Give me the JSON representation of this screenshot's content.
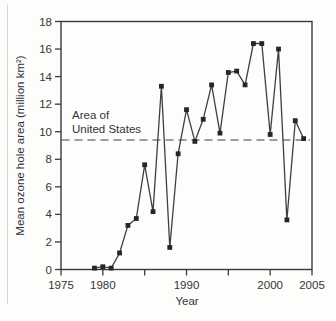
{
  "figure": {
    "background": "#fdfdfc",
    "ink_color": "#3a3a3a"
  },
  "chart_data": {
    "type": "line",
    "title": "",
    "xlabel": "Year",
    "ylabel": "Mean ozone hole area (million km²)",
    "x": [
      1979,
      1980,
      1981,
      1982,
      1983,
      1984,
      1985,
      1986,
      1987,
      1988,
      1989,
      1990,
      1991,
      1992,
      1993,
      1994,
      1995,
      1996,
      1997,
      1998,
      1999,
      2000,
      2001,
      2002,
      2003,
      2004
    ],
    "values": [
      0.1,
      0.2,
      0.1,
      1.2,
      3.2,
      3.7,
      7.6,
      4.2,
      13.3,
      1.6,
      8.4,
      11.6,
      9.3,
      10.9,
      13.4,
      9.9,
      14.3,
      14.4,
      13.4,
      16.4,
      16.4,
      9.8,
      16.0,
      3.6,
      10.8,
      9.5
    ],
    "xlim": [
      1975,
      2005
    ],
    "ylim": [
      0,
      18
    ],
    "xticks": [
      1975,
      1980,
      1985,
      1990,
      1995,
      2000,
      2005
    ],
    "labeled_xticks": [
      1975,
      1980,
      1990,
      2000,
      2005
    ],
    "yticks": [
      0,
      2,
      4,
      6,
      8,
      10,
      12,
      14,
      16,
      18
    ],
    "grid": false,
    "legend": null,
    "marker": "square",
    "line_color": "#3f3f3f",
    "marker_color": "#262626",
    "frame_color": "#3a3a3a",
    "reference_line": {
      "value": 9.4,
      "style": "dashed",
      "color": "#3f3f3f",
      "label_line1": "Area of",
      "label_line2": "United States"
    }
  }
}
